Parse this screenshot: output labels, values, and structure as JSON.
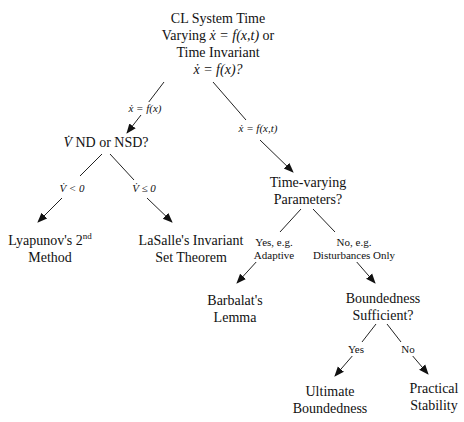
{
  "diagram": {
    "type": "decision-tree",
    "nodes": {
      "root": {
        "line1": "CL System Time",
        "line2_prefix": "Varying ",
        "line2_math": "ẋ = f(x,t)",
        "line2_suffix": " or",
        "line3": "Time Invariant",
        "line4_math": "ẋ = f(x)?"
      },
      "vnd": {
        "math": "V̇",
        "text": " ND or NSD?"
      },
      "lyapunov": {
        "line1": "Lyapunov's 2",
        "sup": "nd",
        "line2": "Method"
      },
      "lasalle": {
        "line1": "LaSalle's Invariant",
        "line2": "Set Theorem"
      },
      "tvparams": {
        "line1": "Time-varying",
        "line2": "Parameters?"
      },
      "barbalat": {
        "line1": "Barbalat's",
        "line2": "Lemma"
      },
      "bounded": {
        "line1": "Boundedness",
        "line2": "Sufficient?"
      },
      "ultimate": {
        "line1": "Ultimate",
        "line2": "Boundedness"
      },
      "practical": {
        "line1": "Practical",
        "line2": "Stability"
      }
    },
    "edge_labels": {
      "root_to_vnd": "ẋ = f(x)",
      "root_to_tv": "ẋ = f(x,t)",
      "vnd_to_lyap": "V̇ < 0",
      "vnd_to_lasalle": "V̇ ≤ 0",
      "tv_yes": {
        "line1": "Yes, e.g.",
        "line2": "Adaptive"
      },
      "tv_no": {
        "line1": "No, e.g.",
        "line2": "Disturbances Only"
      },
      "bound_yes": "Yes",
      "bound_no": "No"
    }
  }
}
